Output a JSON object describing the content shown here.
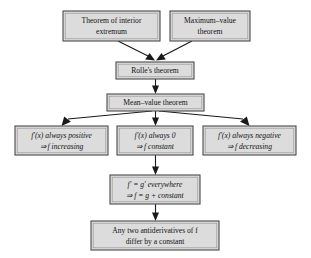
{
  "diagram": {
    "style": {
      "box_fill": "#dcdcdc",
      "box_border": "#4a4a4a",
      "arrow_color": "#1a1a1a",
      "background": "#ffffff",
      "text_color": "#121212"
    },
    "nodes": [
      {
        "id": "interior-extremum",
        "lines": [
          "Theorem of interior",
          "extremum"
        ],
        "x": 63,
        "y": 11,
        "w": 97,
        "h": 30
      },
      {
        "id": "maximum-value-theorem",
        "lines": [
          "Maximum–value",
          "theorem"
        ],
        "x": 170,
        "y": 11,
        "w": 80,
        "h": 30
      },
      {
        "id": "rolles-theorem",
        "lines": [
          "Rolle's theorem"
        ],
        "x": 116,
        "y": 62,
        "w": 78,
        "h": 17
      },
      {
        "id": "mean-value-theorem",
        "lines": [
          "Mean–value theorem"
        ],
        "x": 107,
        "y": 94,
        "w": 97,
        "h": 17
      },
      {
        "id": "f-prime-positive",
        "lines": [
          "f′(x) always positive",
          "⇒ f increasing"
        ],
        "x": 15,
        "y": 126,
        "w": 93,
        "h": 29
      },
      {
        "id": "f-prime-zero",
        "lines": [
          "f′(x) always 0",
          "⇒ f constant"
        ],
        "x": 117,
        "y": 126,
        "w": 76,
        "h": 29
      },
      {
        "id": "f-prime-negative",
        "lines": [
          "f′(x) always negative",
          "⇒ f decreasing"
        ],
        "x": 203,
        "y": 126,
        "w": 93,
        "h": 29
      },
      {
        "id": "f-equals-g-everywhere",
        "lines": [
          "f′ = g′ everywhere",
          "⇒ f = g + constant"
        ],
        "x": 110,
        "y": 175,
        "w": 90,
        "h": 29
      },
      {
        "id": "antiderivatives-differ",
        "lines": [
          "Any two antiderivatives of f",
          "differ by a constant"
        ],
        "x": 91,
        "y": 221,
        "w": 128,
        "h": 29
      }
    ],
    "edges": [
      {
        "id": "interior-to-rolle",
        "from": "interior-extremum",
        "to": "rolles-theorem"
      },
      {
        "id": "maxvalue-to-rolle",
        "from": "maximum-value-theorem",
        "to": "rolles-theorem"
      },
      {
        "id": "rolle-to-mvt",
        "from": "rolles-theorem",
        "to": "mean-value-theorem"
      },
      {
        "id": "mvt-to-positive",
        "from": "mean-value-theorem",
        "to": "f-prime-positive"
      },
      {
        "id": "mvt-to-zero",
        "from": "mean-value-theorem",
        "to": "f-prime-zero"
      },
      {
        "id": "mvt-to-negative",
        "from": "mean-value-theorem",
        "to": "f-prime-negative"
      },
      {
        "id": "zero-to-fg",
        "from": "f-prime-zero",
        "to": "f-equals-g-everywhere"
      },
      {
        "id": "fg-to-antiderivatives",
        "from": "f-equals-g-everywhere",
        "to": "antiderivatives-differ"
      }
    ]
  }
}
